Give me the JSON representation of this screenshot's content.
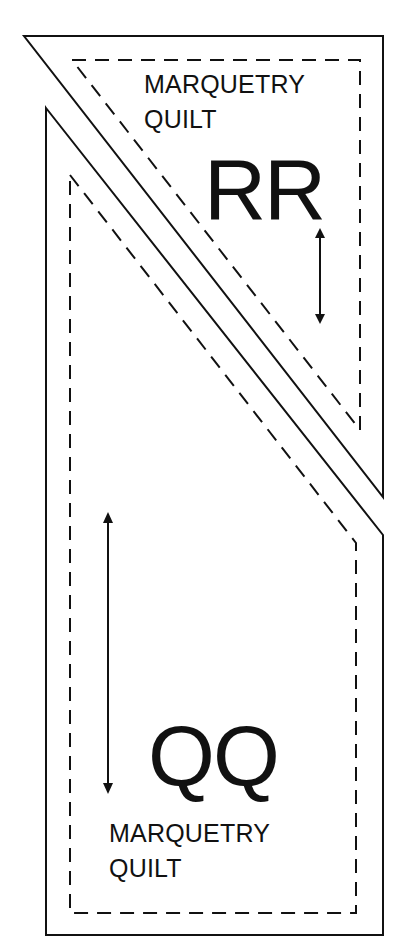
{
  "diagram": {
    "type": "quilt-pattern-template",
    "line_color": "#111111",
    "background": "#ffffff",
    "pieces": [
      {
        "id": "RR",
        "shape": "right-triangle (top-right)",
        "code": "RR",
        "label_line1": "MARQUETRY",
        "label_line2": "QUILT",
        "grain_arrow": "vertical double-headed",
        "cut_line": "solid",
        "seam_line": "dashed"
      },
      {
        "id": "QQ",
        "shape": "trapezoid with diagonal top edge",
        "code": "QQ",
        "label_line1": "MARQUETRY",
        "label_line2": "QUILT",
        "grain_arrow": "vertical double-headed",
        "cut_line": "solid",
        "seam_line": "dashed"
      }
    ]
  }
}
